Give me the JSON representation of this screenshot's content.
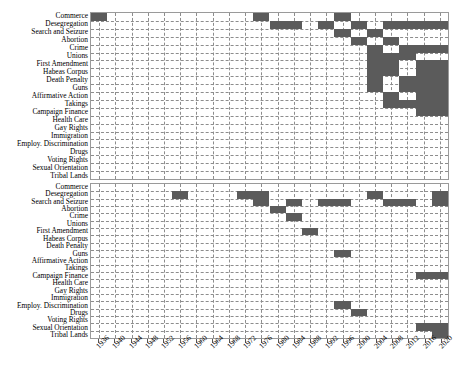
{
  "chart_data": {
    "type": "heatmap",
    "title": "",
    "xlabel": "",
    "ylabel": "",
    "xlim": [
      1934,
      2022
    ],
    "grid": true,
    "legend": null,
    "fill_color": "#5b5b5b",
    "background_color": "#ffffff",
    "gridline_color": "#8d8d8d",
    "xticks": [
      1936,
      1940,
      1944,
      1948,
      1952,
      1956,
      1960,
      1964,
      1968,
      1972,
      1976,
      1980,
      1984,
      1988,
      1992,
      1996,
      2000,
      2004,
      2008,
      2012,
      2016,
      2020
    ],
    "xtick_labels": [
      "1936",
      "1940",
      "1944",
      "1948",
      "1952",
      "1956",
      "1960",
      "1964",
      "1968",
      "1972",
      "1976",
      "1980",
      "1984",
      "1988",
      "1992",
      "1996",
      "2000",
      "2004",
      "2008",
      "2012",
      "2016",
      "2020"
    ],
    "categories": [
      "Commerce",
      "Desegregation",
      "Search and Seizure",
      "Abortion",
      "Crime",
      "Unions",
      "First Amendment",
      "Habeas Corpus",
      "Death Penalty",
      "Guns",
      "Affirmative Action",
      "Takings",
      "Campaign Finance",
      "Health Care",
      "Gay Rights",
      "Immigration",
      "Employ. Discrimination",
      "Drugs",
      "Voting Rights",
      "Sexual Orientation",
      "Tribal Lands"
    ],
    "panels": [
      {
        "name": "top-panel",
        "categories": [
          "Commerce",
          "Desegregation",
          "Search and Seizure",
          "Abortion",
          "Crime",
          "Unions",
          "First Amendment",
          "Habeas Corpus",
          "Death Penalty",
          "Guns",
          "Affirmative Action",
          "Takings",
          "Campaign Finance",
          "Health Care",
          "Gay Rights",
          "Immigration",
          "Employ. Discrimination",
          "Drugs",
          "Voting Rights",
          "Sexual Orientation",
          "Tribal Lands"
        ],
        "spans": [
          {
            "category": "Commerce",
            "start": 1934,
            "end": 1938
          },
          {
            "category": "Commerce",
            "start": 1974,
            "end": 1978
          },
          {
            "category": "Commerce",
            "start": 1994,
            "end": 1998
          },
          {
            "category": "Desegregation",
            "start": 1978,
            "end": 1986
          },
          {
            "category": "Desegregation",
            "start": 1990,
            "end": 1994
          },
          {
            "category": "Desegregation",
            "start": 1998,
            "end": 2002
          },
          {
            "category": "Desegregation",
            "start": 2006,
            "end": 2022
          },
          {
            "category": "Search and Seizure",
            "start": 1994,
            "end": 1998
          },
          {
            "category": "Search and Seizure",
            "start": 2002,
            "end": 2006
          },
          {
            "category": "Abortion",
            "start": 1998,
            "end": 2002
          },
          {
            "category": "Abortion",
            "start": 2006,
            "end": 2010
          },
          {
            "category": "Crime",
            "start": 2002,
            "end": 2006
          },
          {
            "category": "Crime",
            "start": 2010,
            "end": 2022
          },
          {
            "category": "Unions",
            "start": 2002,
            "end": 2014
          },
          {
            "category": "First Amendment",
            "start": 2002,
            "end": 2010
          },
          {
            "category": "First Amendment",
            "start": 2014,
            "end": 2022
          },
          {
            "category": "Habeas Corpus",
            "start": 2002,
            "end": 2010
          },
          {
            "category": "Habeas Corpus",
            "start": 2014,
            "end": 2022
          },
          {
            "category": "Death Penalty",
            "start": 2002,
            "end": 2006
          },
          {
            "category": "Death Penalty",
            "start": 2010,
            "end": 2022
          },
          {
            "category": "Guns",
            "start": 2002,
            "end": 2006
          },
          {
            "category": "Guns",
            "start": 2010,
            "end": 2022
          },
          {
            "category": "Affirmative Action",
            "start": 2006,
            "end": 2010
          },
          {
            "category": "Affirmative Action",
            "start": 2014,
            "end": 2022
          },
          {
            "category": "Takings",
            "start": 2006,
            "end": 2022
          },
          {
            "category": "Campaign Finance",
            "start": 2014,
            "end": 2022
          }
        ]
      },
      {
        "name": "bottom-panel",
        "categories": [
          "Commerce",
          "Desegregation",
          "Search and Seizure",
          "Abortion",
          "Crime",
          "Unions",
          "First Amendment",
          "Habeas Corpus",
          "Death Penalty",
          "Guns",
          "Affirmative Action",
          "Takings",
          "Campaign Finance",
          "Health Care",
          "Gay Rights",
          "Immigration",
          "Employ. Discrimination",
          "Drugs",
          "Voting Rights",
          "Sexual Orientation",
          "Tribal Lands"
        ],
        "spans": [
          {
            "category": "Desegregation",
            "start": 1954,
            "end": 1958
          },
          {
            "category": "Desegregation",
            "start": 1970,
            "end": 1978
          },
          {
            "category": "Desegregation",
            "start": 2002,
            "end": 2006
          },
          {
            "category": "Desegregation",
            "start": 2018,
            "end": 2022
          },
          {
            "category": "Search and Seizure",
            "start": 1974,
            "end": 1978
          },
          {
            "category": "Search and Seizure",
            "start": 1982,
            "end": 1986
          },
          {
            "category": "Search and Seizure",
            "start": 1990,
            "end": 1998
          },
          {
            "category": "Search and Seizure",
            "start": 2006,
            "end": 2014
          },
          {
            "category": "Search and Seizure",
            "start": 2018,
            "end": 2022
          },
          {
            "category": "Abortion",
            "start": 1978,
            "end": 1982
          },
          {
            "category": "Crime",
            "start": 1982,
            "end": 1986
          },
          {
            "category": "First Amendment",
            "start": 1986,
            "end": 1990
          },
          {
            "category": "Guns",
            "start": 1994,
            "end": 1998
          },
          {
            "category": "Campaign Finance",
            "start": 2014,
            "end": 2022
          },
          {
            "category": "Employ. Discrimination",
            "start": 1994,
            "end": 1998
          },
          {
            "category": "Drugs",
            "start": 1998,
            "end": 2002
          },
          {
            "category": "Sexual Orientation",
            "start": 2014,
            "end": 2022
          },
          {
            "category": "Tribal Lands",
            "start": 2018,
            "end": 2022
          }
        ]
      }
    ]
  }
}
